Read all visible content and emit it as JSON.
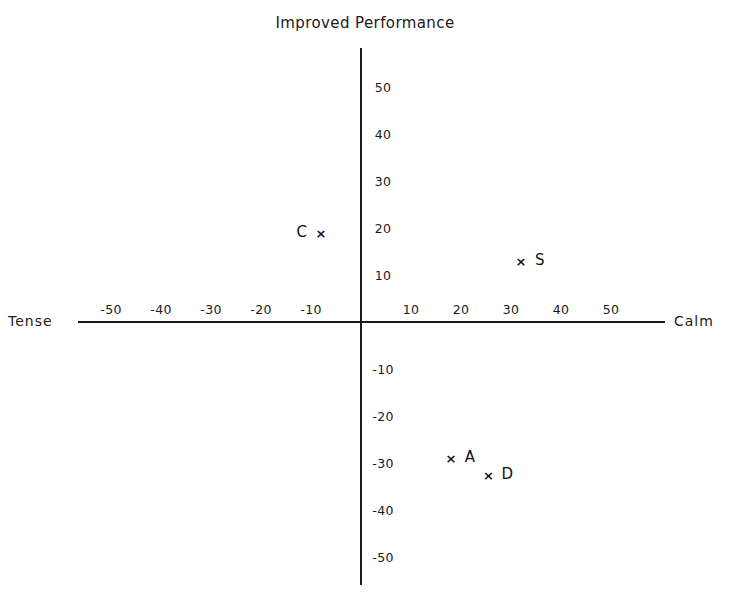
{
  "chart_data": {
    "type": "scatter",
    "title": "Improved Performance",
    "xlabel_left": "Tense",
    "xlabel_right": "Calm",
    "ylabel": "Improved Performance",
    "xlim": [
      -58,
      60
    ],
    "ylim": [
      -55,
      57
    ],
    "grid": false,
    "legend": "none",
    "xticks": [
      -50,
      -40,
      -30,
      -20,
      -10,
      10,
      20,
      30,
      40,
      50
    ],
    "xtick_labels": [
      "-50",
      "-40",
      "-30",
      "-20",
      "-10",
      "10",
      "20",
      "30",
      "40",
      "50"
    ],
    "yticks": [
      50,
      40,
      30,
      20,
      10,
      -10,
      -20,
      -30,
      -40,
      -50
    ],
    "ytick_labels": [
      "50",
      "40",
      "30",
      "20",
      "10",
      "-10",
      "-20",
      "-30",
      "-40",
      "-50"
    ],
    "marker": "x",
    "points": [
      {
        "label": "C",
        "x": -8,
        "y": 19,
        "label_side": "left"
      },
      {
        "label": "S",
        "x": 32,
        "y": 13,
        "label_side": "right"
      },
      {
        "label": "A",
        "x": 18,
        "y": -29,
        "label_side": "right"
      },
      {
        "label": "D",
        "x": 25.5,
        "y": -32.5,
        "label_side": "right"
      }
    ]
  },
  "axes": {
    "origin_x": 361,
    "origin_y": 322,
    "px_per_unit_x": 5.0,
    "px_per_unit_y": 4.7
  }
}
